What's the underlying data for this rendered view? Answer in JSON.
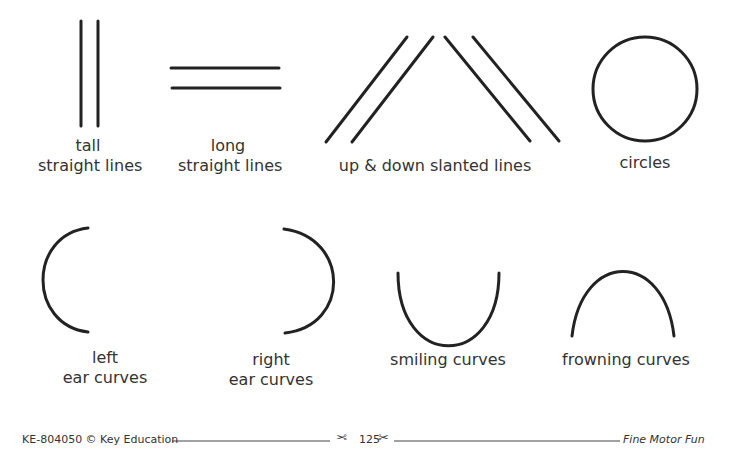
{
  "worksheet": {
    "stroke_color": "#222222",
    "items": [
      {
        "id": "tall-straight-lines",
        "line1": "tall",
        "line2": "straight lines"
      },
      {
        "id": "long-straight-lines",
        "line1": "long",
        "line2": "straight lines"
      },
      {
        "id": "slanted-lines",
        "line1": "up & down slanted lines"
      },
      {
        "id": "circles",
        "line1": "circles"
      },
      {
        "id": "left-ear-curves",
        "line1": "left",
        "line2": "ear curves"
      },
      {
        "id": "right-ear-curves",
        "line1": "right",
        "line2": "ear curves"
      },
      {
        "id": "smiling-curves",
        "line1": "smiling curves"
      },
      {
        "id": "frowning-curves",
        "line1": "frowning curves"
      }
    ]
  },
  "footer": {
    "left_text": "KE-804050 © Key Education",
    "page_number": "125",
    "right_text": "Fine Motor Fun",
    "scissors_left": "✂",
    "scissors_right": "✂"
  }
}
